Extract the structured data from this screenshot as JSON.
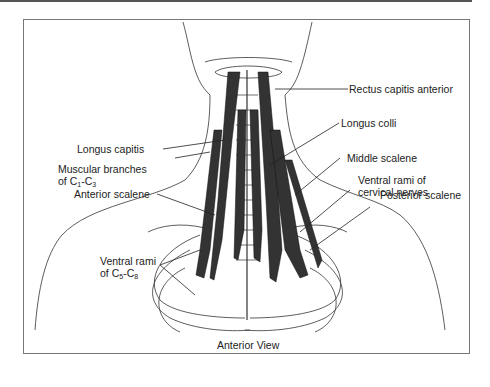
{
  "figure": {
    "caption": "Anterior View",
    "labels": {
      "rectus_capitis_anterior": "Rectus capitis anterior",
      "longus_capitis": "Longus capitis",
      "longus_colli": "Longus colli",
      "muscular_branches_line1": "Muscular branches",
      "muscular_branches_line2_prefix": "of C",
      "muscular_branches_sub1": "1",
      "muscular_branches_dash": "-C",
      "muscular_branches_sub2": "3",
      "middle_scalene": "Middle scalene",
      "anterior_scalene": "Anterior scalene",
      "ventral_rami_cervical_line1": "Ventral rami of",
      "ventral_rami_cervical_line2": "cervical nerves",
      "posterior_scalene": "Posterior scalene",
      "ventral_rami_c5c8_line1": "Ventral rami",
      "ventral_rami_c5c8_line2_prefix": "of C",
      "ventral_rami_c5c8_sub1": "5",
      "ventral_rami_c5c8_dash": "-C",
      "ventral_rami_c5c8_sub2": "8"
    }
  }
}
